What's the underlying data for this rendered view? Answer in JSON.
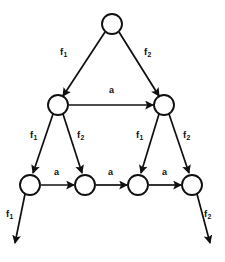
{
  "diagram": {
    "style": {
      "stroke_color": "#101010",
      "fill_color": "#ffffff",
      "background": "#ffffff"
    },
    "nodes": [
      {
        "id": "n0",
        "cx": 112,
        "cy": 24,
        "r": 10,
        "level": 0
      },
      {
        "id": "n1",
        "cx": 58,
        "cy": 105,
        "r": 10,
        "level": 1
      },
      {
        "id": "n2",
        "cx": 164,
        "cy": 105,
        "r": 10,
        "level": 1
      },
      {
        "id": "n3",
        "cx": 30,
        "cy": 185,
        "r": 10,
        "level": 2
      },
      {
        "id": "n4",
        "cx": 85,
        "cy": 185,
        "r": 10,
        "level": 2
      },
      {
        "id": "n5",
        "cx": 138,
        "cy": 185,
        "r": 10,
        "level": 2
      },
      {
        "id": "n6",
        "cx": 192,
        "cy": 185,
        "r": 10,
        "level": 2
      }
    ],
    "edges": [
      {
        "id": "e1",
        "from": "n0",
        "to": "n1",
        "label": "f",
        "sub": "1",
        "label_x": 60,
        "label_y": 47,
        "x1": 105,
        "y1": 32,
        "x2": 63,
        "y2": 96
      },
      {
        "id": "e2",
        "from": "n0",
        "to": "n2",
        "label": "f",
        "sub": "2",
        "label_x": 144,
        "label_y": 47,
        "x1": 119,
        "y1": 32,
        "x2": 159,
        "y2": 96
      },
      {
        "id": "e3",
        "from": "n1",
        "to": "n2",
        "label": "a",
        "sub": "",
        "label_x": 109,
        "label_y": 86,
        "x1": 69,
        "y1": 105,
        "x2": 153,
        "y2": 105
      },
      {
        "id": "e4",
        "from": "n1",
        "to": "n3",
        "label": "f",
        "sub": "1",
        "label_x": 30,
        "label_y": 130,
        "x1": 53,
        "y1": 114,
        "x2": 33,
        "y2": 173
      },
      {
        "id": "e5",
        "from": "n1",
        "to": "n4",
        "label": "f",
        "sub": "2",
        "label_x": 77,
        "label_y": 130,
        "x1": 63,
        "y1": 114,
        "x2": 82,
        "y2": 173
      },
      {
        "id": "e6",
        "from": "n2",
        "to": "n5",
        "label": "f",
        "sub": "1",
        "label_x": 136,
        "label_y": 130,
        "x1": 159,
        "y1": 114,
        "x2": 141,
        "y2": 173
      },
      {
        "id": "e7",
        "from": "n2",
        "to": "n6",
        "label": "f",
        "sub": "2",
        "label_x": 183,
        "label_y": 130,
        "x1": 169,
        "y1": 114,
        "x2": 189,
        "y2": 173
      },
      {
        "id": "e8",
        "from": "n3",
        "to": "n4",
        "label": "a",
        "sub": "",
        "label_x": 54,
        "label_y": 168,
        "x1": 41,
        "y1": 185,
        "x2": 74,
        "y2": 185
      },
      {
        "id": "e9",
        "from": "n4",
        "to": "n5",
        "label": "a",
        "sub": "",
        "label_x": 108,
        "label_y": 168,
        "x1": 96,
        "y1": 185,
        "x2": 127,
        "y2": 185
      },
      {
        "id": "e10",
        "from": "n5",
        "to": "n6",
        "label": "a",
        "sub": "",
        "label_x": 162,
        "label_y": 168,
        "x1": 149,
        "y1": 185,
        "x2": 181,
        "y2": 185
      },
      {
        "id": "e11",
        "from": "n3",
        "to": "out-left",
        "label": "f",
        "sub": "1",
        "label_x": 6,
        "label_y": 209,
        "x1": 25,
        "y1": 194,
        "x2": 15,
        "y2": 243
      },
      {
        "id": "e12",
        "from": "n6",
        "to": "out-right",
        "label": "f",
        "sub": "2",
        "label_x": 204,
        "label_y": 209,
        "x1": 197,
        "y1": 194,
        "x2": 210,
        "y2": 243
      }
    ]
  }
}
